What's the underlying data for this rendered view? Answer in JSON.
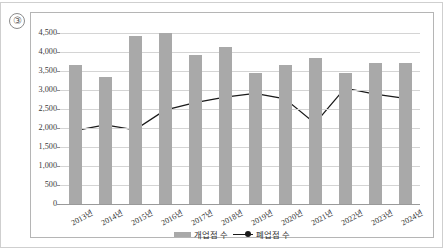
{
  "figure": {
    "item_marker": "③"
  },
  "legend": {
    "position": "bottom-center",
    "entries": [
      {
        "label": "개업점 수",
        "type": "bar",
        "color": "#a9a9a9"
      },
      {
        "label": "폐업점 수",
        "type": "line",
        "color": "#1a1a1a"
      }
    ]
  },
  "chart_data": {
    "type": "bar",
    "title": "",
    "subtitle": "",
    "xlabel": "",
    "ylabel": "",
    "ylim": [
      0,
      4500
    ],
    "ytick_values": [
      0,
      500,
      1000,
      1500,
      2000,
      2500,
      3000,
      3500,
      4000,
      4500
    ],
    "ytick_labels": [
      "0",
      "500",
      "1,000",
      "1,500",
      "2,000",
      "2,500",
      "3,000",
      "3,500",
      "4,000",
      "4,500"
    ],
    "grid": true,
    "grid_axis": "y",
    "categories": [
      "2013년",
      "2014년",
      "2015년",
      "2016년",
      "2017년",
      "2018년",
      "2019년",
      "2020년",
      "2021년",
      "2022년",
      "2023년",
      "2024년"
    ],
    "series": [
      {
        "name": "개업점 수",
        "type": "bar",
        "color": "#a9a9a9",
        "values": [
          3670,
          3350,
          4420,
          4500,
          3930,
          4120,
          3450,
          3670,
          3840,
          3440,
          3720,
          3720
        ]
      },
      {
        "name": "폐업점 수",
        "type": "line",
        "color": "#1a1a1a",
        "marker": "circle",
        "values": [
          1930,
          2080,
          1950,
          2470,
          2670,
          2810,
          2910,
          2770,
          2120,
          3050,
          2890,
          2780
        ]
      }
    ]
  }
}
